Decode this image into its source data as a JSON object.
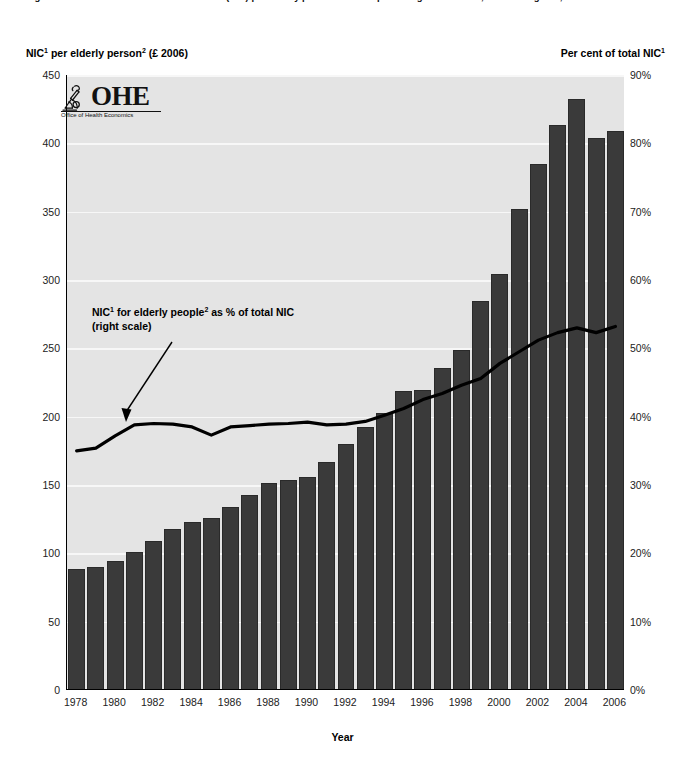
{
  "caption": {
    "text": "Figure 3.6  National Insurance Contributions (NIC) per elderly person and as a percentage of total NIC, United Kingdom, 1978 to 2006"
  },
  "left_axis_title": {
    "pre": "NIC",
    "sup1": "1",
    "mid": " per elderly person",
    "sup2": "2",
    "post": " (£ 2006)"
  },
  "right_axis_title": {
    "pre": "Per cent of total NIC",
    "sup1": "1"
  },
  "xaxis_title": "Year",
  "annotation": {
    "line1_pre": "NIC",
    "line1_sup1": "1",
    "line1_mid": " for elderly people",
    "line1_sup2": "2",
    "line1_post": " as % of total NIC",
    "line2": "(right scale)"
  },
  "logo": {
    "wordmark": "OHE",
    "subtitle": "Office of Health Economics",
    "icon": "microscope-icon"
  },
  "chart_data": {
    "type": "bar",
    "xlabel": "Year",
    "ylabel": "NIC per elderly person (£ 2006)",
    "y2label": "Per cent of total NIC",
    "ylim": [
      0,
      450
    ],
    "y2lim": [
      0,
      90
    ],
    "grid": true,
    "legend_position": "none",
    "yticks": [
      0,
      50,
      100,
      150,
      200,
      250,
      300,
      350,
      400,
      450
    ],
    "ytick_labels": [
      "0",
      "50",
      "100",
      "150",
      "200",
      "250",
      "300",
      "350",
      "400",
      "450"
    ],
    "y2ticks": [
      0,
      10,
      20,
      30,
      40,
      50,
      60,
      70,
      80,
      90
    ],
    "y2tick_labels": [
      "0%",
      "10%",
      "20%",
      "30%",
      "40%",
      "50%",
      "60%",
      "70%",
      "80%",
      "90%"
    ],
    "categories": [
      "1978",
      "1979",
      "1980",
      "1981",
      "1982",
      "1983",
      "1984",
      "1985",
      "1986",
      "1987",
      "1988",
      "1989",
      "1990",
      "1991",
      "1992",
      "1993",
      "1994",
      "1995",
      "1996",
      "1997",
      "1998",
      "1999",
      "2000",
      "2001",
      "2002",
      "2003",
      "2004",
      "2005",
      "2006"
    ],
    "xtick_labels": [
      "1978",
      "1980",
      "1982",
      "1984",
      "1986",
      "1988",
      "1990",
      "1992",
      "1994",
      "1996",
      "1998",
      "2000",
      "2002",
      "2004",
      "2006"
    ],
    "series": [
      {
        "name": "NIC per elderly person (£ 2006)",
        "type": "bar",
        "axis": "left",
        "color": "#3a3a3a",
        "values": [
          88,
          89,
          94,
          100,
          108,
          117,
          122,
          125,
          133,
          142,
          151,
          153,
          155,
          166,
          179,
          192,
          202,
          218,
          219,
          235,
          248,
          284,
          304,
          351,
          384,
          413,
          432,
          403,
          408
        ]
      },
      {
        "name": "NIC for elderly people as % of total NIC",
        "type": "line",
        "axis": "right",
        "color": "#000000",
        "values": [
          35.0,
          35.4,
          37.2,
          38.8,
          39.0,
          38.9,
          38.5,
          37.3,
          38.5,
          38.7,
          38.9,
          39.0,
          39.2,
          38.8,
          38.9,
          39.3,
          40.2,
          41.2,
          42.5,
          43.4,
          44.6,
          45.6,
          47.8,
          49.5,
          51.2,
          52.3,
          53.0,
          52.3,
          53.2
        ]
      }
    ]
  }
}
